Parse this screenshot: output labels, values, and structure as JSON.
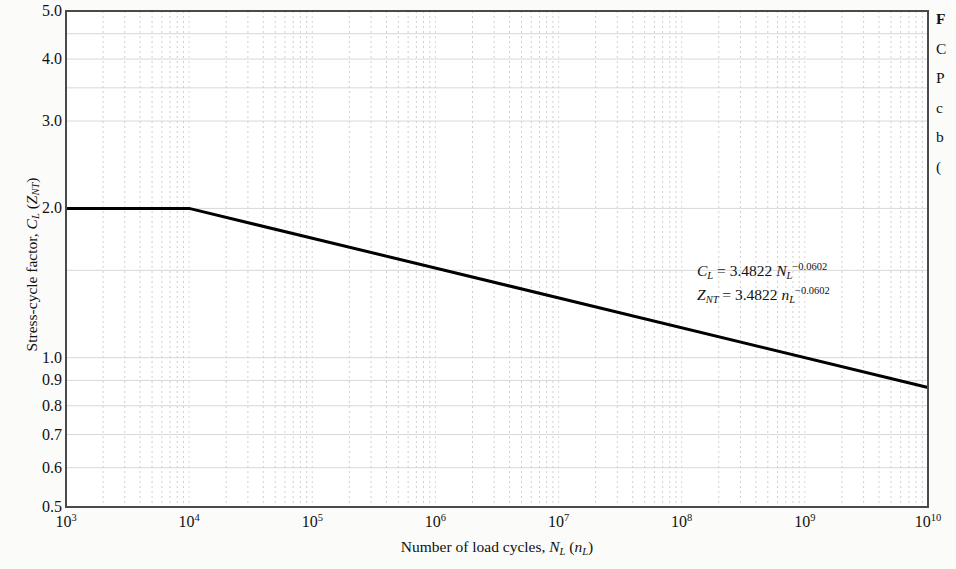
{
  "chart_data": {
    "type": "line",
    "title": "",
    "xlabel": "Number of load cycles, N_L (n_L)",
    "ylabel": "Stress-cycle factor, C_L (Z_NT)",
    "xscale": "log",
    "yscale": "log",
    "xlim": [
      1000,
      10000000000
    ],
    "ylim": [
      0.5,
      5.0
    ],
    "grid": true,
    "legend": null,
    "xticks": [
      {
        "value": 1000,
        "label": "10",
        "exponent": "3"
      },
      {
        "value": 10000,
        "label": "10",
        "exponent": "4"
      },
      {
        "value": 100000,
        "label": "10",
        "exponent": "5"
      },
      {
        "value": 1000000,
        "label": "10",
        "exponent": "6"
      },
      {
        "value": 10000000,
        "label": "10",
        "exponent": "7"
      },
      {
        "value": 100000000,
        "label": "10",
        "exponent": "8"
      },
      {
        "value": 1000000000,
        "label": "10",
        "exponent": "9"
      },
      {
        "value": 10000000000,
        "label": "10",
        "exponent": "10"
      }
    ],
    "yticks": [
      {
        "value": 5.0,
        "label": "5.0"
      },
      {
        "value": 4.0,
        "label": "4.0"
      },
      {
        "value": 3.0,
        "label": "3.0"
      },
      {
        "value": 2.0,
        "label": "2.0"
      },
      {
        "value": 1.0,
        "label": "1.0"
      },
      {
        "value": 0.9,
        "label": "0.9"
      },
      {
        "value": 0.8,
        "label": "0.8"
      },
      {
        "value": 0.7,
        "label": "0.7"
      },
      {
        "value": 0.6,
        "label": "0.6"
      },
      {
        "value": 0.5,
        "label": "0.5"
      }
    ],
    "y_gridlines": [
      5.0,
      4.5,
      4.0,
      3.5,
      3.0,
      2.0,
      1.5,
      1.0,
      0.9,
      0.8,
      0.7,
      0.6,
      0.5
    ],
    "series": [
      {
        "name": "Stress-cycle factor curve",
        "color": "#000000",
        "linewidth": 3,
        "points": [
          {
            "x": 1000,
            "y": 2.0
          },
          {
            "x": 10000,
            "y": 2.0
          },
          {
            "x": 10000000000,
            "y": 0.871
          }
        ]
      }
    ],
    "annotations": [
      {
        "id": "equation-1",
        "text": "C_L = 3.4822 N_L^-0.0602",
        "var": "C",
        "var_sub": "L",
        "eq": " = 3.4822 ",
        "base": "N",
        "base_sub": "L",
        "exp": "−0.0602"
      },
      {
        "id": "equation-2",
        "text": "Z_NT = 3.4822 n_L^-0.0602",
        "var": "Z",
        "var_sub": "NT",
        "eq": " = 3.4822 ",
        "base": "n",
        "base_sub": "L",
        "exp": "−0.0602"
      }
    ],
    "axis_label_parts": {
      "y_main": "Stress-cycle factor, ",
      "y_var": "C",
      "y_var_sub": "L",
      "y_paren_open": " (",
      "y_var2": "Z",
      "y_var2_sub": "NT",
      "y_paren_close": ")",
      "x_main": "Number of load cycles, ",
      "x_var": "N",
      "x_var_sub": "L",
      "x_paren_open": " (",
      "x_var2": "n",
      "x_var2_sub": "L",
      "x_paren_close": ")"
    }
  },
  "caption": {
    "line1": "F",
    "line2": "C",
    "line3": "P",
    "line4": "c",
    "line5": "b",
    "line6": "("
  },
  "colors": {
    "background": "#fbfbfa",
    "plot_background": "#ffffff",
    "axis": "#4a4a4a",
    "gridline": "#d8d8d8",
    "minor_gridline": "#cfcfcf",
    "curve": "#000000",
    "text": "#111111"
  }
}
